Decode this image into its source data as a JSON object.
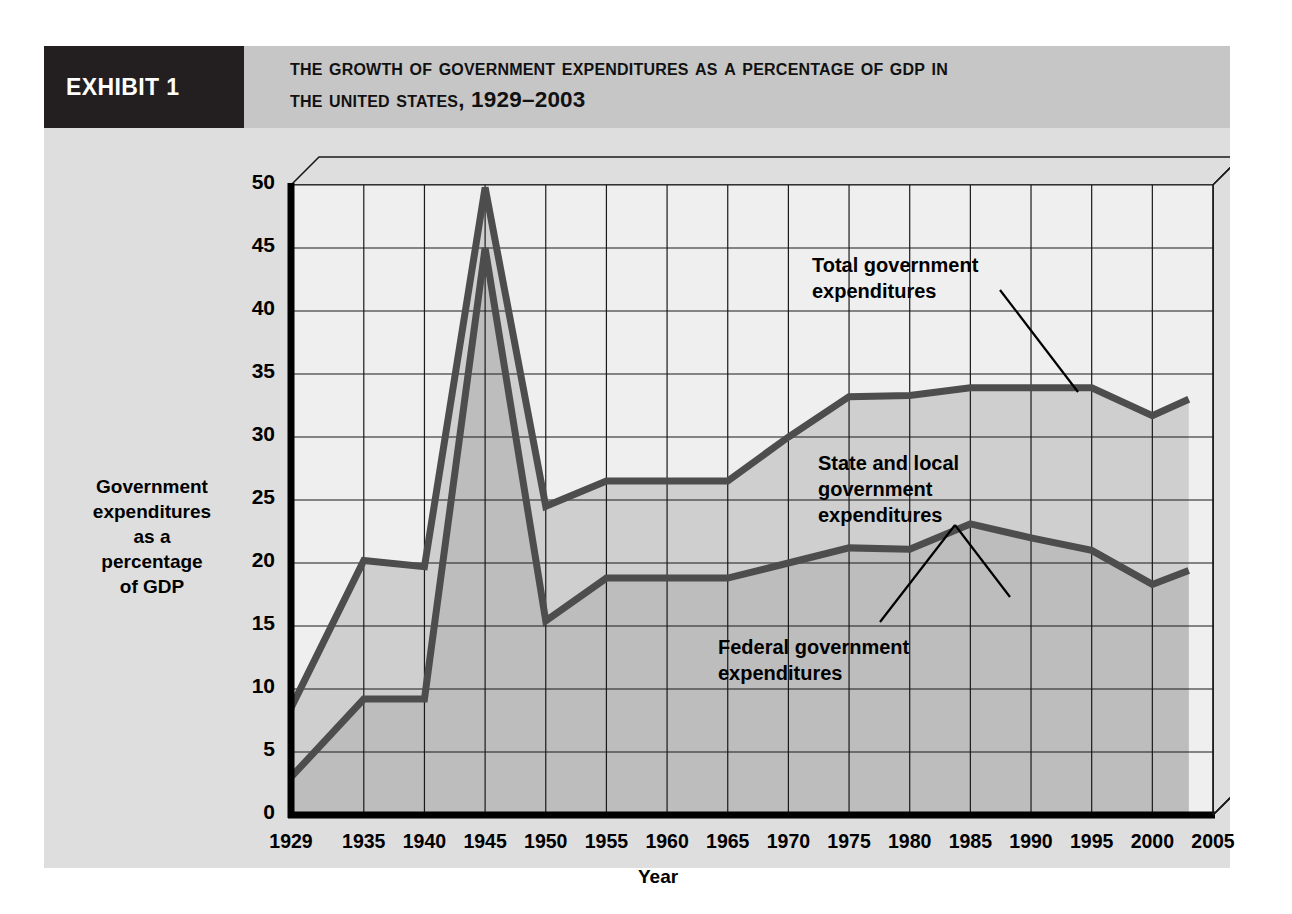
{
  "exhibit": {
    "tag": "EXHIBIT 1",
    "title_line1": "The Growth of Government Expenditures as a Percentage of GDP in",
    "title_line2": "the United States, 1929–2003"
  },
  "colors": {
    "tag_background": "#231f20",
    "header_background": "#c6c6c6",
    "figure_background": "#dedede",
    "plot_background": "#efefef",
    "band_state_local": "#cfcfcf",
    "band_federal": "#bdbdbd",
    "line": "#4d4d4d",
    "grid": "#1a1a1a"
  },
  "chart_data": {
    "type": "area",
    "xlabel": "Year",
    "ylabel": "Government expenditures as a percentage of GDP",
    "ylabel_lines": [
      "Government",
      "expenditures",
      "as a",
      "percentage",
      "of GDP"
    ],
    "grid": true,
    "legend": "annotations",
    "xlim": [
      1929,
      2005
    ],
    "ylim": [
      0,
      50
    ],
    "ytick_labels": [
      "0",
      "5",
      "10",
      "15",
      "20",
      "25",
      "30",
      "35",
      "40",
      "45",
      "50"
    ],
    "yticks": [
      0,
      5,
      10,
      15,
      20,
      25,
      30,
      35,
      40,
      45,
      50
    ],
    "xtick_labels": [
      "1929",
      "1935",
      "1940",
      "1945",
      "1950",
      "1955",
      "1960",
      "1965",
      "1970",
      "1975",
      "1980",
      "1985",
      "1990",
      "1995",
      "2000",
      "2005"
    ],
    "xticks": [
      1929,
      1935,
      1940,
      1945,
      1950,
      1955,
      1960,
      1965,
      1970,
      1975,
      1980,
      1985,
      1990,
      1995,
      2000,
      2005
    ],
    "x": [
      1929,
      1935,
      1940,
      1945,
      1950,
      1955,
      1960,
      1965,
      1970,
      1975,
      1980,
      1985,
      1990,
      1995,
      2000,
      2003
    ],
    "series": [
      {
        "name": "Total government expenditures",
        "values": [
          8.5,
          20.2,
          19.7,
          49.8,
          24.5,
          26.5,
          26.5,
          26.5,
          30.0,
          33.2,
          33.3,
          33.9,
          33.9,
          33.9,
          31.7,
          33.0
        ]
      },
      {
        "name": "Federal government expenditures",
        "values": [
          3.0,
          9.2,
          9.2,
          45.0,
          15.4,
          18.8,
          18.8,
          18.8,
          20.0,
          21.2,
          21.1,
          23.1,
          22.0,
          21.0,
          18.3,
          19.4
        ]
      }
    ],
    "annotations": [
      {
        "name": "total-government-expenditures",
        "lines": [
          "Total government",
          "expenditures"
        ]
      },
      {
        "name": "state-and-local-government-expenditures",
        "lines": [
          "State and local",
          "government",
          "expenditures"
        ]
      },
      {
        "name": "federal-government-expenditures",
        "lines": [
          "Federal government",
          "expenditures"
        ]
      }
    ]
  }
}
